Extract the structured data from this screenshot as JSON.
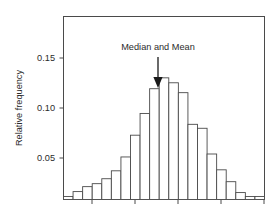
{
  "figure": {
    "title": "",
    "annotation_label": "Median and Mean",
    "ylabel": "Relative frequency",
    "xlabel": "",
    "y_ticks": [
      "0.05",
      "0.10",
      "0.15"
    ],
    "colors": {
      "bar_fill": "#ffffff",
      "bar_stroke": "#4a4a4a",
      "axis": "#4a4a4a",
      "text": "#2b2b2b",
      "arrow": "#1a1a1a",
      "background": "#ffffff"
    }
  },
  "chart_data": {
    "type": "bar",
    "title": "",
    "subtitle": "",
    "xlabel": "",
    "ylabel": "Relative frequency",
    "xlim": [
      0,
      21
    ],
    "ylim": [
      0,
      0.185
    ],
    "grid": false,
    "legend": null,
    "y_tick_values": [
      0.05,
      0.1,
      0.15
    ],
    "y_tick_labels": [
      "0.05",
      "0.10",
      "0.15"
    ],
    "x_tick_values": [
      3,
      7.5,
      12,
      16.5
    ],
    "x_tick_labels": [
      "",
      "",
      "",
      ""
    ],
    "categories": [
      "1",
      "2",
      "3",
      "4",
      "5",
      "6",
      "7",
      "8",
      "9",
      "10",
      "11",
      "12",
      "13",
      "14",
      "15",
      "16",
      "17",
      "18",
      "19",
      "20",
      "21"
    ],
    "values": [
      0.003,
      0.008,
      0.013,
      0.016,
      0.021,
      0.029,
      0.043,
      0.065,
      0.087,
      0.112,
      0.123,
      0.118,
      0.108,
      0.076,
      0.072,
      0.046,
      0.03,
      0.018,
      0.007,
      0.003,
      0.003
    ],
    "annotations": [
      {
        "text": "Median and Mean",
        "points_to_bar_index": 10,
        "points_to_value": 0.123,
        "arrow": "down"
      }
    ]
  }
}
